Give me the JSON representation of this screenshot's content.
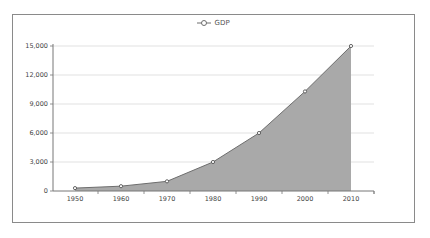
{
  "chart_data": {
    "type": "area",
    "title": "",
    "xlabel": "",
    "ylabel": "",
    "legend": {
      "position": "top",
      "entries": [
        "GDP"
      ]
    },
    "categories": [
      "1950",
      "1960",
      "1970",
      "1980",
      "1990",
      "2000",
      "2010"
    ],
    "series": [
      {
        "name": "GDP",
        "values": [
          300,
          500,
          1000,
          3000,
          6000,
          10300,
          15000
        ]
      }
    ],
    "yticks": [
      "0",
      "3,000",
      "6,000",
      "9,000",
      "12,000",
      "15,000"
    ],
    "ylim": [
      0,
      15000
    ],
    "grid": {
      "horizontal": true,
      "vertical": false
    },
    "colors": {
      "fill": "#a9a9a9",
      "line": "#6e6e6e",
      "grid": "#d9d9d9",
      "axis": "#777777"
    }
  },
  "legend": {
    "label": "GDP"
  }
}
